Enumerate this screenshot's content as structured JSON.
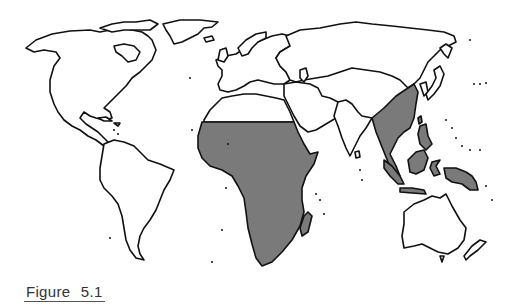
{
  "figure": {
    "caption": "Figure 5.1",
    "type": "world outline map",
    "shaded_color": "#7a7a7a",
    "outline_color": "#111111",
    "background": "#ffffff"
  },
  "regions": {
    "shaded": [
      "Sub-Saharan Africa",
      "Madagascar",
      "Southeast Asia / Southern China",
      "Indonesia",
      "Philippines",
      "New Guinea"
    ],
    "unshaded": [
      "North America",
      "South America",
      "Europe",
      "North Africa",
      "Middle East",
      "India",
      "Russia / Northern Asia",
      "Japan",
      "Australia",
      "New Zealand",
      "Greenland"
    ]
  }
}
